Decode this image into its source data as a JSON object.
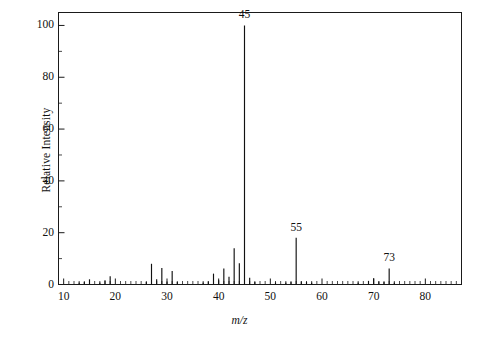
{
  "chart_data": {
    "type": "bar",
    "title": "",
    "subtitle": "",
    "xlabel": "m/z",
    "ylabel": "Relative Intensity",
    "xlim": [
      9,
      87
    ],
    "ylim": [
      0,
      105
    ],
    "grid": false,
    "legend": "none",
    "x_ticks_major": [
      10,
      20,
      30,
      40,
      50,
      60,
      70,
      80
    ],
    "x_tick_labels": [
      "10",
      "20",
      "30",
      "40",
      "50",
      "60",
      "70",
      "80"
    ],
    "x_tick_minor_step": 1,
    "y_ticks": [
      0,
      20,
      40,
      60,
      80,
      100
    ],
    "y_tick_labels": [
      "0",
      "20",
      "40",
      "60",
      "80",
      "100"
    ],
    "series_name": "Relative Intensity",
    "x": [
      13,
      14,
      15,
      17,
      18,
      19,
      26,
      27,
      28,
      29,
      30,
      31,
      32,
      37,
      38,
      39,
      40,
      41,
      42,
      43,
      44,
      45,
      46,
      47,
      51,
      53,
      54,
      55,
      56,
      57,
      58,
      67,
      69,
      70,
      71,
      72,
      73,
      74
    ],
    "values": [
      0.8,
      1.0,
      2.0,
      0.8,
      1.6,
      3.2,
      1.0,
      8.0,
      2.0,
      6.4,
      1.2,
      5.2,
      1.0,
      0.8,
      1.2,
      4.2,
      1.6,
      6.2,
      3.0,
      14.0,
      8.2,
      100.0,
      2.6,
      1.0,
      0.8,
      0.8,
      1.0,
      18.0,
      1.2,
      1.0,
      0.8,
      0.8,
      1.4,
      2.4,
      1.2,
      1.0,
      6.2,
      0.8
    ],
    "labeled_peaks": [
      {
        "mz": 45,
        "label": "45",
        "intensity": 100.0
      },
      {
        "mz": 55,
        "label": "55",
        "intensity": 18.0
      },
      {
        "mz": 73,
        "label": "73",
        "intensity": 6.2
      }
    ],
    "colors": {
      "line": "#111111",
      "axis": "#1a1a1a",
      "background": "#ffffff"
    }
  }
}
